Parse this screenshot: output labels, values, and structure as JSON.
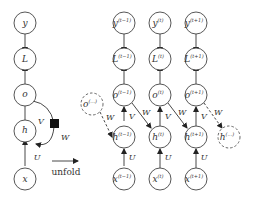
{
  "folded": {
    "nodes": {
      "y": "y",
      "L": "L",
      "o": "o",
      "h": "h",
      "x": "x"
    },
    "edge_labels": {
      "V": "V",
      "W": "W",
      "U": "U"
    }
  },
  "unfold_label": "unfold",
  "unfolded": {
    "columns": [
      {
        "y": "y",
        "L": "L",
        "o": "o",
        "h": "h",
        "x": "x",
        "sup": "(t−1)"
      },
      {
        "y": "y",
        "L": "L",
        "o": "o",
        "h": "h",
        "x": "x",
        "sup": "(t)"
      },
      {
        "y": "y",
        "L": "L",
        "o": "o",
        "h": "h",
        "x": "x",
        "sup": "(t+1)"
      }
    ],
    "prev_node": {
      "label": "o",
      "sup": "(...)"
    },
    "next_node": {
      "label": "h",
      "sup": "(...)"
    },
    "edge_labels": {
      "V": "V",
      "W": "W",
      "U": "U"
    }
  }
}
